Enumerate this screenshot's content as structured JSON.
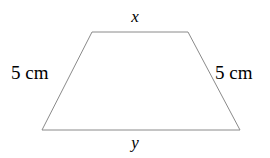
{
  "figure": {
    "type": "geometry-diagram",
    "shape_name": "isosceles-trapezoid",
    "background_color": "#ffffff",
    "stroke_color": "#8a8a8a",
    "stroke_width": 1,
    "canvas": {
      "width": 270,
      "height": 158
    },
    "vertices": {
      "top_left": {
        "x": 92,
        "y": 32
      },
      "top_right": {
        "x": 188,
        "y": 32
      },
      "bottom_right": {
        "x": 240,
        "y": 130
      },
      "bottom_left": {
        "x": 42,
        "y": 130
      }
    },
    "polygon_points": "92,32 188,32 240,130 42,130"
  },
  "labels": {
    "top": "x",
    "bottom": "y",
    "left_side": "5 cm",
    "right_side": "5 cm"
  }
}
